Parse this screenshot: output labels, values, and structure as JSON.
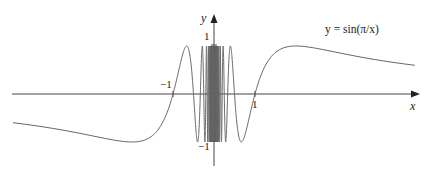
{
  "chart_data": {
    "type": "line",
    "title": "",
    "function": "y = sin(π/x)",
    "series": [
      {
        "name": "y = sin(π/x)",
        "formula": "sin(pi/x)",
        "x_range": [
          -4.9,
          4.9
        ],
        "color": "#555555"
      }
    ],
    "xlabel": "x",
    "ylabel": "y",
    "x_ticks": [
      {
        "value": -1,
        "label": "−1"
      },
      {
        "value": 1,
        "label": "1"
      }
    ],
    "y_ticks": [
      {
        "value": 1,
        "label": "1"
      },
      {
        "value": -1,
        "label": "−1"
      }
    ],
    "xlim": [
      -4.9,
      4.9
    ],
    "ylim": [
      -1.6,
      1.6
    ],
    "grid": false,
    "legend": {
      "text": "y = sin(π/x)",
      "position": "top-right"
    },
    "annotations": [
      "y = sin(π/x)"
    ],
    "sample_points": [
      {
        "x": -4.9,
        "y": -0.6
      },
      {
        "x": -2,
        "y": -1.0
      },
      {
        "x": -1,
        "y": 0.0
      },
      {
        "x": -0.667,
        "y": 1.0
      },
      {
        "x": -0.5,
        "y": 0.0
      },
      {
        "x": -0.4,
        "y": -1.0
      },
      {
        "x": 0.4,
        "y": 1.0
      },
      {
        "x": 0.5,
        "y": 0.0
      },
      {
        "x": 0.667,
        "y": -1.0
      },
      {
        "x": 1,
        "y": 0.0
      },
      {
        "x": 2,
        "y": 1.0
      },
      {
        "x": 4.9,
        "y": 0.6
      }
    ]
  },
  "labels": {
    "x_axis": "x",
    "y_axis": "y",
    "tick_x_neg1": "−1",
    "tick_x_1": "1",
    "tick_y_1": "1",
    "tick_y_neg1": "−1",
    "equation": "y = sin(π/x)"
  }
}
